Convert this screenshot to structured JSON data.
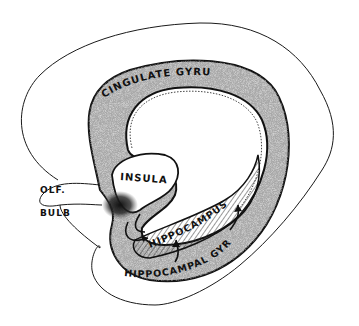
{
  "diagram": {
    "type": "anatomical line drawing",
    "colors": {
      "background": "#ffffff",
      "outline": "#1a1a1a",
      "stipple": "#9a9a9a",
      "dark_stipple": "#222222",
      "hatch": "#333333"
    },
    "labels": {
      "cingulate_gyrus": "CINGULATE GYRUS",
      "insula": "INSULA",
      "olf": "OLF.",
      "bulb": "BULB",
      "hippocampus": "HIPPOCAMPUS",
      "hippocampal_gyrus": "HIPPOCAMPAL GYRUS"
    },
    "regions": [
      {
        "name": "hemisphere outline",
        "style": "thin line"
      },
      {
        "name": "cingulate gyrus",
        "style": "stippled band"
      },
      {
        "name": "insula",
        "style": "white region with dark stipple at base"
      },
      {
        "name": "olfactory bulb",
        "style": "outline lobe"
      },
      {
        "name": "hippocampus",
        "style": "diagonal hatching"
      },
      {
        "name": "hippocampal gyrus",
        "style": "stippled band"
      }
    ],
    "arrows": 4
  }
}
